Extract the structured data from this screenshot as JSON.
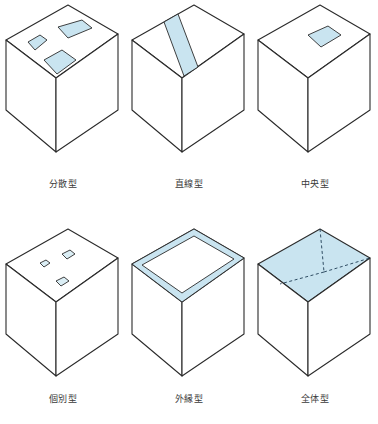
{
  "figure": {
    "title": "",
    "colors": {
      "fill_blue": "#c9e4f0",
      "outline": "#2b2b2b",
      "background": "#ffffff",
      "caption_text": "#3a3a3a"
    }
  },
  "diagrams": [
    {
      "id": "bunsan",
      "label": "分散型",
      "icon_name": "cube-scattered-patches",
      "pattern": "scattered",
      "description": "Isometric cube with three separate light-blue rectangular patches scattered across the top face",
      "patch_count": 3
    },
    {
      "id": "chokusen",
      "label": "直線型",
      "icon_name": "cube-linear-band",
      "pattern": "linear",
      "description": "Isometric cube with a single light-blue band running straight across the top face",
      "patch_count": 1
    },
    {
      "id": "chuo",
      "label": "中央型",
      "icon_name": "cube-central-square",
      "pattern": "central",
      "description": "Isometric cube with one light-blue square centered on the top face",
      "patch_count": 1
    },
    {
      "id": "kobetsu",
      "label": "個別型",
      "icon_name": "cube-individual-dots",
      "pattern": "individual",
      "description": "Isometric cube with three small light-blue squares placed individually on the top face",
      "patch_count": 3
    },
    {
      "id": "gaien",
      "label": "外縁型",
      "icon_name": "cube-outer-ring",
      "pattern": "perimeter",
      "description": "Isometric cube with a light-blue ring band around the outer edge of the top face",
      "patch_count": 1
    },
    {
      "id": "zentai",
      "label": "全体型",
      "icon_name": "cube-whole-face",
      "pattern": "whole",
      "description": "Isometric cube with the entire top face filled light blue and dashed division lines",
      "patch_count": 1
    }
  ]
}
